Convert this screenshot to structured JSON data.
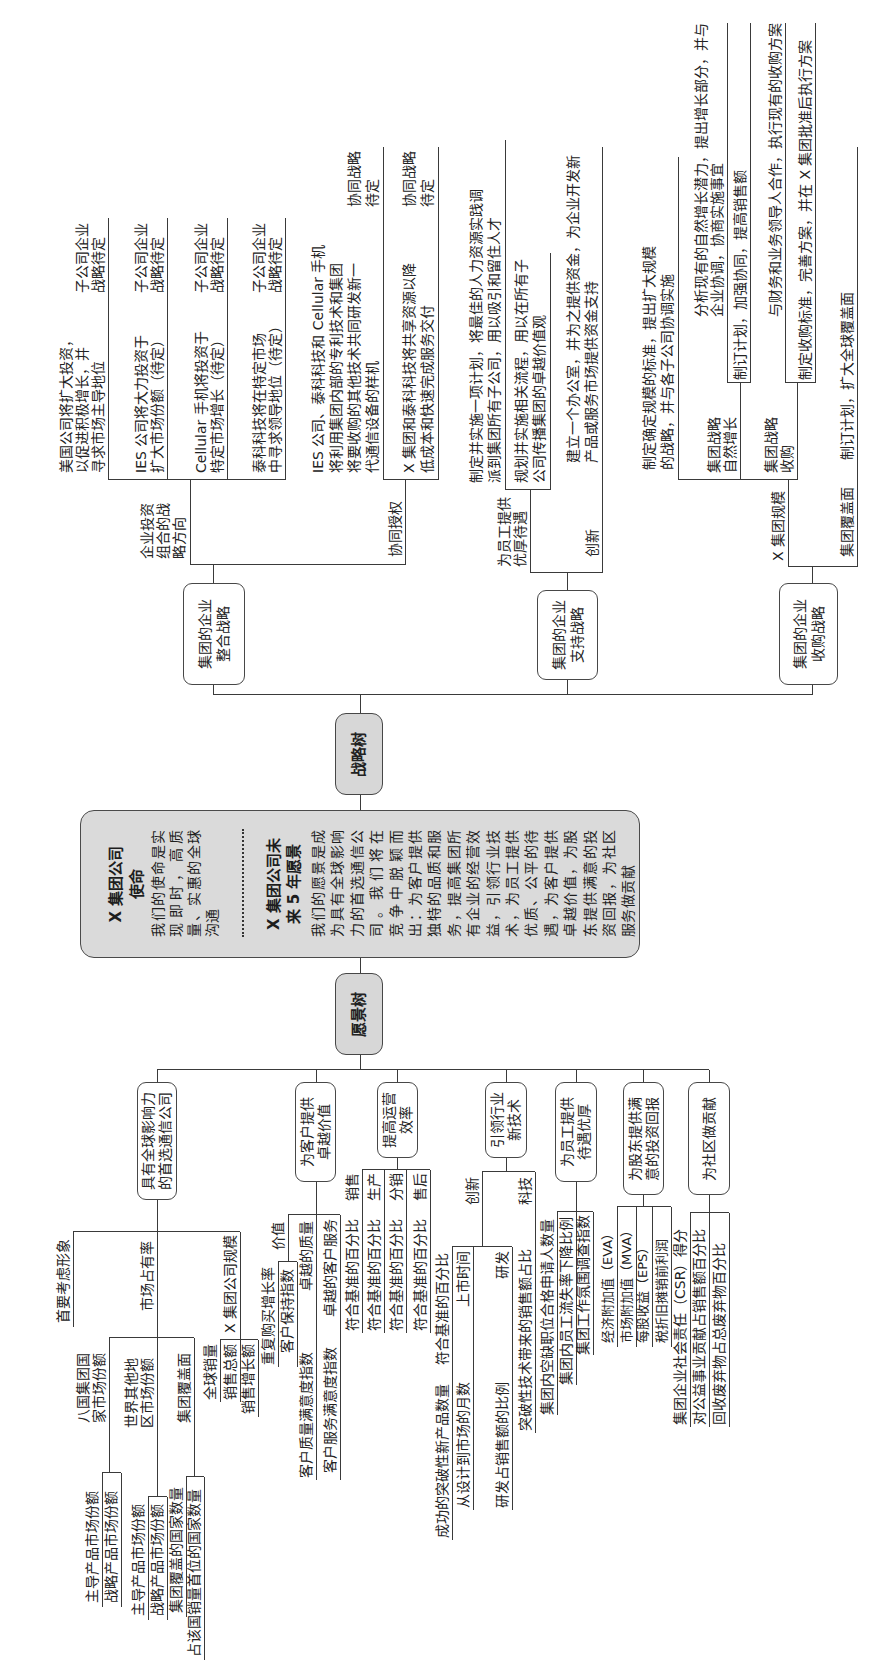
{
  "center": {
    "strategy_tree_node": "战略树",
    "vision_tree_node": "愿景树",
    "mission": {
      "title": [
        "X 集团公司",
        "使命"
      ],
      "lines": [
        "我们的使命是实",
        "现即时，高质",
        "量、实惠的全球",
        "沟通"
      ]
    },
    "vision": {
      "title": [
        "X 集团公司未",
        "来 5 年愿景"
      ],
      "lines": [
        "我们的愿景是成",
        "为具有全球影响",
        "力的首选通信公",
        "司。我们将在",
        "竞争中脱颖而",
        "出：为客户提供",
        "独特的品质和服",
        "务，提高集团所",
        "有企业的经营效",
        "益，引领行业技",
        "术，为员工提供",
        "优质、公平的待",
        "遇，为客户提供",
        "卓越价值，为股",
        "东提供满意的投",
        "资回报，为社区",
        "服务做贡献"
      ]
    }
  },
  "strategy_tree": {
    "integration": {
      "label": "集团的企业\n整合战略",
      "portfolio": {
        "label": "企业投资\n组合的战\n略方向",
        "items": [
          {
            "text": "美国公司将扩大投资，\n以促进积极增长，并\n寻求市场主导地位",
            "result": "子公司企业\n战略待定"
          },
          {
            "text": "IES 公司将大力投资于\n扩大市场份额（待定）",
            "result": "子公司企业\n战略待定"
          },
          {
            "text": "Cellular 手机将投资于\n特定市场增长（待定）",
            "result": "子公司企业\n战略待定"
          },
          {
            "text": "泰科科技将在特定市场\n中寻求领导地位（待定）",
            "result": "子公司企业\n战略待定"
          }
        ]
      },
      "synergy": {
        "label": "协同授权",
        "items": [
          {
            "text": "IES 公司、泰科科技和 Cellular 手机\n将利用集团内部的专利技术和集团\n将要收购的其他技术共同研发新一\n代通信设备的样机",
            "result": "协同战略\n待定"
          },
          {
            "text": "X 集团和泰科科技将共享资源以降\n低成本和快速完成服务交付",
            "result": "协同战略\n待定"
          }
        ]
      }
    },
    "support": {
      "label": "集团的企业\n支持战略",
      "employees": {
        "label": "为员工提供\n优厚待遇",
        "items": [
          "制定并实施一项计划，将最佳的人力资源实践调\n派到集团所有子公司，用以吸引和留住人才",
          "规划并实施相关流程，用以在所有子\n公司传播集团的卓越价值观"
        ]
      },
      "innovation": {
        "label": "创新",
        "items": [
          "建立一个办公室，并为之提供资金，为企业开发新\n产品或服务市场提供资金支持"
        ]
      }
    },
    "acquisition": {
      "label": "集团的企业\n收购战略",
      "scale": {
        "label": "X 集团规模",
        "items": [
          "制定确定规模的标准，提出扩大规模\n的战略，并与各子公司协调实施"
        ],
        "organic": {
          "label": "集团战略\n自然增长",
          "items": [
            "分析现有的自然增长潜力，提出增长部分，并与\n企业协调，协商实施事宜",
            "制订计划，加强协同，提高销售额"
          ]
        },
        "acquire": {
          "label": "集团战略\n收购",
          "items": [
            "与财务和业务领导人合作，执行现有的收购方案",
            "制定收购标准，完善方案，并在 X 集团批准后执行方案"
          ]
        }
      },
      "coverage": {
        "label": "集团覆盖面",
        "items": [
          "制订计划，扩大全球覆盖面"
        ]
      }
    }
  },
  "vision_tree": {
    "goals": [
      {
        "label": "具有全球影响力\n的首选通信公司",
        "children": [
          {
            "label": "首要考虑形象"
          },
          {
            "label": "市场占有率",
            "children": [
              {
                "label": "八国集团国\n家市场份额",
                "children": [
                  "主导产品市场份额",
                  "战略产品市场份额"
                ]
              },
              {
                "label": "世界其他地\n区市场份额",
                "children": [
                  "主导产品市场份额",
                  "战略产品市场份额"
                ]
              },
              {
                "label": "集团覆盖面",
                "children": [
                  "集团覆盖的国家数量",
                  "占该国销量首位的国家数量"
                ]
              }
            ]
          },
          {
            "label": "X 集团公司规模",
            "children": [
              "全球销量",
              "销售总额",
              "销售增长额"
            ]
          }
        ]
      },
      {
        "label": "为客户提供\n卓越价值",
        "children": [
          {
            "label": "价值",
            "children": [
              "重复购买增长率",
              "客户保持指数"
            ]
          },
          {
            "label": "卓越的质量",
            "children": [
              "客户质量满意度指数"
            ]
          },
          {
            "label": "卓越的客户服务",
            "children": [
              "客户服务满意度指数"
            ]
          }
        ]
      },
      {
        "label": "提高运营\n效率",
        "children": [
          {
            "label": "销售",
            "children": [
              "符合基准的百分比"
            ]
          },
          {
            "label": "生产",
            "children": [
              "符合基准的百分比"
            ]
          },
          {
            "label": "分销",
            "children": [
              "符合基准的百分比"
            ]
          },
          {
            "label": "售后",
            "children": [
              "符合基准的百分比"
            ]
          }
        ]
      },
      {
        "label": "引领行业\n新技术",
        "children": [
          {
            "label": "创新",
            "children": [
              {
                "label": "符合基准的百分比",
                "children": [
                  "成功的突破性新产品数量"
                ]
              },
              {
                "label": "上市时间",
                "children": [
                  "从设计到市场的月数"
                ]
              },
              {
                "label": "研发",
                "children": [
                  "研发占销售额的比例"
                ]
              }
            ]
          },
          {
            "label": "科技",
            "children": [
              "突破性技术带来的销售额占比"
            ]
          }
        ]
      },
      {
        "label": "为员工提供\n待遇优厚",
        "children": [
          "集团内空缺职位合格申请人数量",
          "集团内员工流失率下降比例",
          "集团工作氛围调查指数"
        ]
      },
      {
        "label": "为股东提供满\n意的投资回报",
        "children": [
          "经济附加值（EVA）",
          "市场附加值（MVA）",
          "每股收益（EPS）",
          "税折旧摊销前利润"
        ]
      },
      {
        "label": "为社区做贡献",
        "children": [
          "集团企业社会责任（CSR）得分",
          "对公益事业贡献占销售额百分比",
          "回收废弃物占总废弃物百分比"
        ]
      }
    ]
  },
  "colors": {
    "root_fill": "#d7d7d7",
    "center_fill": "#dadada",
    "line": "#3a3a3a",
    "text": "#222222",
    "node_fill": "#ffffff"
  }
}
